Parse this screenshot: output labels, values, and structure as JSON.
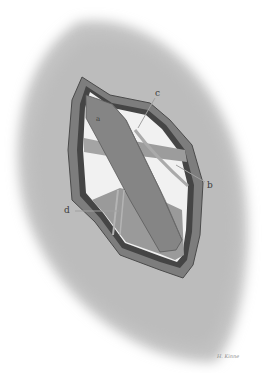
{
  "figure": {
    "labels": [
      {
        "id": "a",
        "text": "a",
        "x": 96,
        "y": 117
      },
      {
        "id": "b",
        "text": "b",
        "x": 208,
        "y": 182
      },
      {
        "id": "c",
        "text": "c",
        "x": 155,
        "y": 90
      },
      {
        "id": "d",
        "text": "d",
        "x": 64,
        "y": 207
      }
    ],
    "signature": "H. Kinne",
    "colors": {
      "skin_shade": "#bdbdbd",
      "wound_rim": "#6e6e6e",
      "wound_rim_dark": "#3f3f3f",
      "tissue": "#8f8f8f",
      "tendon": "#7a7a7a",
      "cavity_light": "#f2f2f2"
    }
  }
}
